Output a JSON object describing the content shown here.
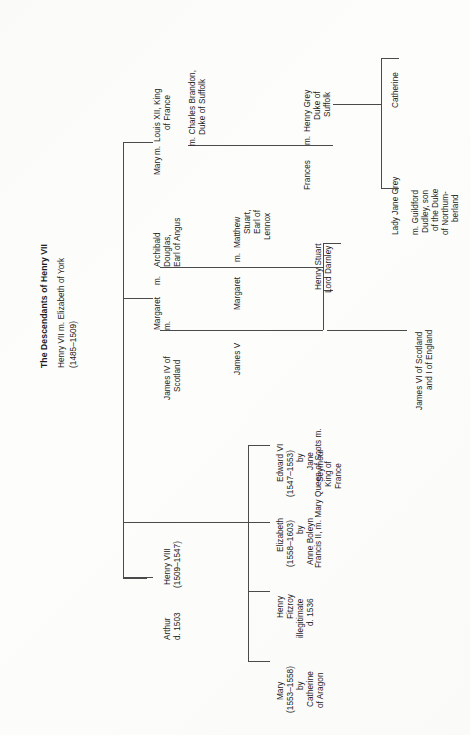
{
  "document": {
    "title": "The Descendants of Henry VII",
    "root": {
      "name": "Henry VII m. Elizabeth of York",
      "dates": "(1485–1509)"
    }
  },
  "generation_2": [
    {
      "id": "arthur",
      "lines": [
        "Arthur",
        "d. 1503"
      ]
    },
    {
      "id": "henry8",
      "lines": [
        "Henry VIII",
        "(1509–1547)"
      ]
    },
    {
      "id": "james4",
      "lines": [
        "James IV of",
        "Scotland"
      ],
      "marriage_marker": "m."
    },
    {
      "id": "margaret1",
      "lines": [
        "Margaret"
      ],
      "marriage_marker": "m.",
      "spouse": [
        "Archibald",
        "Douglas,",
        "Earl of Angus"
      ]
    },
    {
      "id": "mary_tudor",
      "lines": [
        "Mary"
      ],
      "marriage_marker": "m.",
      "spouse": [
        "Louis XII, King",
        "of France"
      ],
      "second_marriage": [
        "m. Charles Brandon,",
        "Duke of Suffolk"
      ]
    }
  ],
  "generation_3": [
    {
      "id": "mary1",
      "lines": [
        "Mary",
        "(1553–1558)",
        "by",
        "Catherine",
        "of Aragon"
      ]
    },
    {
      "id": "henry_fitzroy",
      "lines": [
        "Henry",
        "Fitzroy",
        "illegitimate",
        "d. 1536"
      ]
    },
    {
      "id": "elizabeth1",
      "lines": [
        "Elizabeth",
        "(1558–1603)",
        "by",
        "Anne Boleyn"
      ]
    },
    {
      "id": "edward6",
      "lines": [
        "Edward VI",
        "(1547–1553)",
        "by",
        "Jane",
        "Seymour"
      ]
    },
    {
      "id": "james5",
      "lines": [
        "James V"
      ]
    },
    {
      "id": "margaret2",
      "lines": [
        "Margaret"
      ],
      "marriage_marker": "m.",
      "spouse": [
        "Matthew",
        "Stuart,",
        "Earl of",
        "Lennox"
      ]
    },
    {
      "id": "frances",
      "lines": [
        "Frances"
      ],
      "marriage_marker": "m.",
      "spouse": [
        "Henry Grey",
        "Duke of",
        "Suffolk"
      ]
    }
  ],
  "generation_4": [
    {
      "id": "mary_queen_of_scots",
      "prefix": "Francis II, m. Mary Queen of Scots m.",
      "prefix_extra": [
        "King of",
        "France"
      ],
      "spouse": [
        "Henry Stuart",
        "Lord Darnley"
      ]
    },
    {
      "id": "lady_jane_grey",
      "lines": [
        "Lady Jane Grey"
      ],
      "marriage": [
        "m. Guildford",
        "Dudley, son",
        "of the Duke",
        "of Northum-",
        "berland"
      ]
    },
    {
      "id": "catherine_grey",
      "lines": [
        "Catherine"
      ]
    }
  ],
  "generation_5": [
    {
      "id": "james6",
      "lines": [
        "James VI of Scotland",
        "and I of England"
      ]
    }
  ],
  "style": {
    "line_color": "#4a4a4a",
    "text_color": "#1c1c1c",
    "background": "#fdfdfc"
  }
}
